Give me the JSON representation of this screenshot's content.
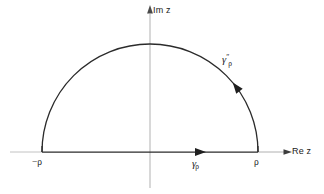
{
  "figure": {
    "background_color": "#ffffff",
    "width": 324,
    "height": 194
  },
  "axes": {
    "imaginary": {
      "label": "Im z",
      "icon": "arrow-up-icon",
      "color": "#b3b3b3",
      "x_position": 150,
      "top": 12,
      "bottom": 188
    },
    "real": {
      "label": "Re z",
      "icon": "arrow-right-icon",
      "color": "#b3b3b3",
      "y_position": 152,
      "left": 10,
      "right": 288
    }
  },
  "points": [
    {
      "name": "left-endpoint",
      "label": "−ρ",
      "x": 42,
      "y": 152
    },
    {
      "name": "right-endpoint",
      "label": "ρ",
      "x": 258,
      "y": 152
    }
  ],
  "contour": {
    "color": "#2b2b2b",
    "radius": 108,
    "center_x": 150,
    "center_y": 152,
    "apex_y": 44,
    "arc": {
      "name": "semicircular-arc",
      "label_base": "γ",
      "label_superscript": "″",
      "label_subscript": "ρ",
      "direction": "counterclockwise",
      "arrow_angle_deg": 40
    },
    "segment": {
      "name": "real-axis-segment",
      "label_base": "γ",
      "label_superscript": "",
      "label_subscript": "ρ",
      "direction": "rightward",
      "from_x": 42,
      "to_x": 258,
      "arrow_x": 203
    }
  },
  "colors": {
    "contour_stroke": "#2b2b2b",
    "axis_stroke": "#b3b3b3",
    "axis_stroke_dark": "#8a8a8a",
    "text": "#1a1a1a"
  }
}
